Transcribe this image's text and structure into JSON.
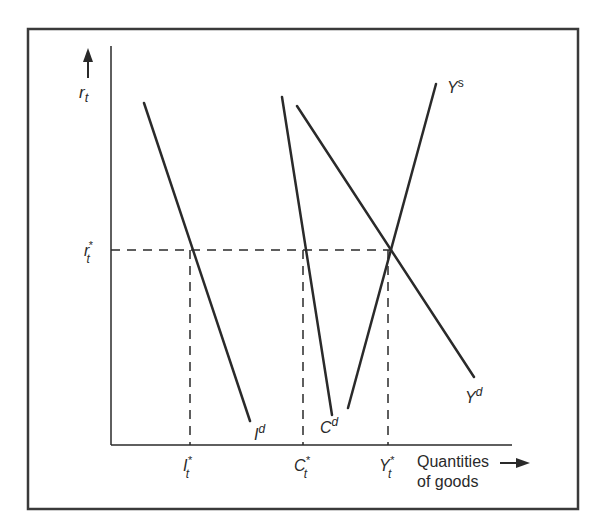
{
  "diagram": {
    "type": "macroeconomic goods market equilibrium",
    "y_axis": {
      "label": "r",
      "label_sub": "t",
      "arrow": "up-arrow"
    },
    "x_axis": {
      "label_line1": "Quantities",
      "label_line2": "of goods",
      "arrow": "right-arrow"
    },
    "equilibrium_rate": {
      "label": "r",
      "sub": "t",
      "sup": "*"
    },
    "curves": [
      {
        "name": "investment-demand",
        "label": "I",
        "sup": "d"
      },
      {
        "name": "consumption-demand",
        "label": "C",
        "sup": "d"
      },
      {
        "name": "output-demand",
        "label": "Y",
        "sup": "d"
      },
      {
        "name": "output-supply",
        "label": "Y",
        "sup": "s"
      }
    ],
    "x_ticks": [
      {
        "label": "I",
        "sub": "t",
        "sup": "*"
      },
      {
        "label": "C",
        "sub": "t",
        "sup": "*"
      },
      {
        "label": "Y",
        "sub": "t",
        "sup": "*"
      }
    ],
    "colors": {
      "line": "#2a2a2a",
      "frame": "#3a3a3a",
      "background": "#ffffff"
    }
  }
}
